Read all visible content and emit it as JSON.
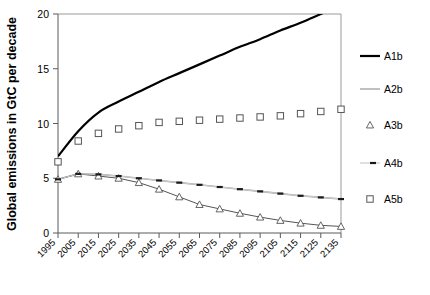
{
  "chart_data": {
    "type": "line",
    "title": "",
    "xlabel": "",
    "ylabel": "Global emissions in GtC per decade",
    "categories": [
      "1995",
      "2005",
      "2015",
      "2025",
      "2035",
      "2045",
      "2055",
      "2065",
      "2075",
      "2085",
      "2095",
      "2105",
      "2115",
      "2125",
      "2135"
    ],
    "x": [
      1995,
      2005,
      2015,
      2025,
      2035,
      2045,
      2055,
      2065,
      2075,
      2085,
      2095,
      2105,
      2115,
      2125,
      2135
    ],
    "xlim": [
      1995,
      2135
    ],
    "ylim": [
      0,
      20
    ],
    "yticks": [
      "0",
      "5",
      "10",
      "15",
      "20"
    ],
    "ytick_values": [
      0,
      5,
      10,
      15,
      20
    ],
    "grid": false,
    "legend_position": "right",
    "series": [
      {
        "name": "A1b",
        "style": "line-thick-black",
        "color": "#000000",
        "marker": "none",
        "values": [
          7.0,
          9.3,
          11.0,
          12.0,
          12.9,
          13.8,
          14.6,
          15.4,
          16.2,
          17.0,
          17.7,
          18.5,
          19.2,
          20.0,
          20.8
        ]
      },
      {
        "name": "A2b",
        "style": "line-thin-gray",
        "color": "#a6a6a6",
        "marker": "none",
        "values": [
          4.9,
          5.4,
          5.35,
          5.2,
          5.0,
          4.8,
          4.6,
          4.4,
          4.2,
          4.0,
          3.8,
          3.6,
          3.4,
          3.25,
          3.1
        ]
      },
      {
        "name": "A3b",
        "style": "line-marker-triangle",
        "color": "#555555",
        "marker": "triangle",
        "values": [
          4.9,
          5.4,
          5.2,
          5.0,
          4.6,
          4.0,
          3.3,
          2.6,
          2.2,
          1.8,
          1.45,
          1.15,
          0.9,
          0.7,
          0.6
        ]
      },
      {
        "name": "A4b",
        "style": "line-dashed-marker",
        "color": "#1a1a1a",
        "marker": "dash",
        "values": [
          4.9,
          5.4,
          5.35,
          5.2,
          5.0,
          4.8,
          4.6,
          4.4,
          4.2,
          4.0,
          3.8,
          3.6,
          3.4,
          3.25,
          3.1
        ]
      },
      {
        "name": "A5b",
        "style": "marker-square",
        "color": "#555555",
        "marker": "square",
        "values": [
          6.5,
          8.4,
          9.1,
          9.5,
          9.8,
          10.1,
          10.2,
          10.3,
          10.4,
          10.5,
          10.6,
          10.7,
          10.9,
          11.1,
          11.3
        ]
      }
    ]
  },
  "legend": {
    "items": [
      {
        "label": "A1b"
      },
      {
        "label": "A2b"
      },
      {
        "label": "A3b"
      },
      {
        "label": "A4b"
      },
      {
        "label": "A5b"
      }
    ]
  }
}
